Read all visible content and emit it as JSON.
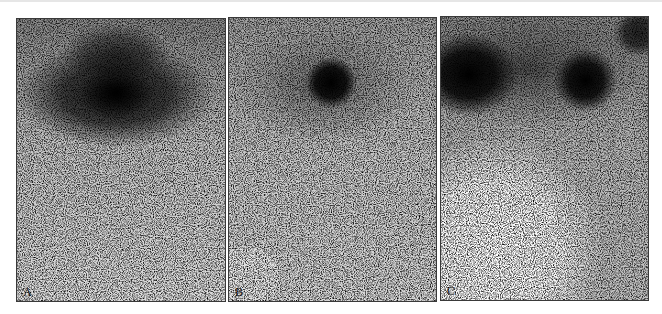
{
  "figure": {
    "type": "scintigraphy image series",
    "panels": [
      {
        "label": "A",
        "description": "broad dark uptake band across upper third with darkest focus near center",
        "hotspots": [
          {
            "cx": 0.48,
            "cy": 0.26,
            "rx": 0.46,
            "ry": 0.17,
            "intensity": 0.85
          },
          {
            "cx": 0.48,
            "cy": 0.26,
            "rx": 0.16,
            "ry": 0.09,
            "intensity": 1.0
          },
          {
            "cx": 0.48,
            "cy": 0.12,
            "rx": 0.25,
            "ry": 0.1,
            "intensity": 0.6
          }
        ]
      },
      {
        "label": "B",
        "description": "single small focal dark spot in upper center-right, faint diffuse halo",
        "hotspots": [
          {
            "cx": 0.49,
            "cy": 0.23,
            "rx": 0.11,
            "ry": 0.08,
            "intensity": 1.0
          },
          {
            "cx": 0.45,
            "cy": 0.24,
            "rx": 0.45,
            "ry": 0.2,
            "intensity": 0.35
          }
        ]
      },
      {
        "label": "C",
        "description": "two dark foci: large one at upper left, rounder one at upper right; bright void lower left",
        "hotspots": [
          {
            "cx": 0.14,
            "cy": 0.2,
            "rx": 0.22,
            "ry": 0.14,
            "intensity": 1.0
          },
          {
            "cx": 0.7,
            "cy": 0.22,
            "rx": 0.14,
            "ry": 0.11,
            "intensity": 1.0
          },
          {
            "cx": 0.95,
            "cy": 0.06,
            "rx": 0.12,
            "ry": 0.08,
            "intensity": 0.8
          },
          {
            "cx": 0.4,
            "cy": 0.18,
            "rx": 0.6,
            "ry": 0.2,
            "intensity": 0.45
          }
        ]
      }
    ]
  },
  "colors": {
    "border": "#3a3a3a",
    "background": "#ffffff",
    "dark": "#111111"
  }
}
